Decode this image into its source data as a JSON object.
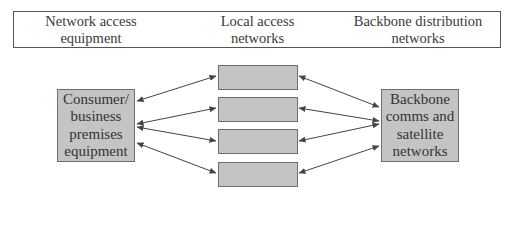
{
  "header": {
    "columns": [
      {
        "label": "Network access\nequipment"
      },
      {
        "label": "Local access\nnetworks"
      },
      {
        "label": "Backbone distribution\nnetworks"
      }
    ]
  },
  "nodes": {
    "left": {
      "label": "Consumer/\nbusiness\npremises\nequipment"
    },
    "middle": [
      {
        "label": ""
      },
      {
        "label": ""
      },
      {
        "label": ""
      },
      {
        "label": ""
      }
    ],
    "right": {
      "label": "Backbone\ncomms and\nsatellite\nnetworks"
    }
  },
  "colors": {
    "node_fill": "#c4c4c4",
    "node_border": "#6e6e6e",
    "arrow": "#444444",
    "header_border": "#555555"
  }
}
